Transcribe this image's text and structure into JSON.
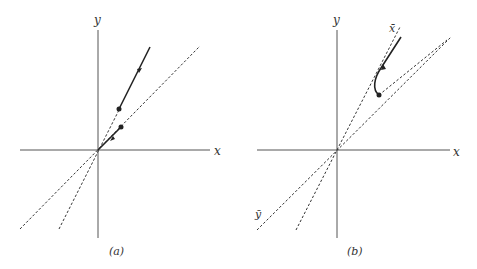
{
  "panels": [
    {
      "id": "a",
      "caption": "(a)",
      "axes": {
        "x_label": "x",
        "y_label": "y"
      },
      "description": "Trajectories starting on two invariant lines through the origin: one moving away along the steeper line, one moving toward the origin along the shallower line."
    },
    {
      "id": "b",
      "caption": "(b)",
      "axes": {
        "x_label": "x",
        "y_label": "y"
      },
      "line_labels": {
        "x_bar": "x̄",
        "y_bar": "ȳ"
      },
      "description": "Trajectory starting near the ȳ line curves and then moves away along the x̄ line."
    }
  ]
}
